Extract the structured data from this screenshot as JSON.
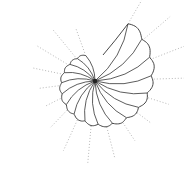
{
  "image": {
    "subject": "nautilus shell line drawing",
    "width": 184,
    "height": 181,
    "center": [
      95,
      81
    ],
    "stroke_color": "#333333",
    "dotted_color": "#b8b8b8",
    "background": "#ffffff"
  },
  "spiral": {
    "chambers": 17
  },
  "rays": {
    "count": 17,
    "style": "dotted"
  }
}
